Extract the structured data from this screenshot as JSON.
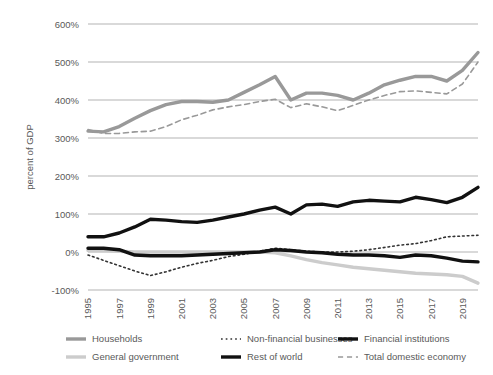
{
  "chart_data": {
    "type": "line",
    "title": "",
    "xlabel": "",
    "ylabel": "percent of GDP",
    "ylim": [
      -100,
      600
    ],
    "yticks": [
      -100,
      0,
      100,
      200,
      300,
      400,
      500,
      600
    ],
    "ytick_labels": [
      "-100%",
      "0%",
      "100%",
      "200%",
      "300%",
      "400%",
      "500%",
      "600%"
    ],
    "grid": true,
    "legend_position": "bottom",
    "x": [
      1995,
      1996,
      1997,
      1998,
      1999,
      2000,
      2001,
      2002,
      2003,
      2004,
      2005,
      2006,
      2007,
      2008,
      2009,
      2010,
      2011,
      2012,
      2013,
      2014,
      2015,
      2016,
      2017,
      2018,
      2019,
      2020
    ],
    "xtick_labels": [
      "1995",
      "1997",
      "1999",
      "2001",
      "2003",
      "2005",
      "2007",
      "2009",
      "2011",
      "2013",
      "2015",
      "2017",
      "2019"
    ],
    "xticks": [
      1995,
      1997,
      1999,
      2001,
      2003,
      2005,
      2007,
      2009,
      2011,
      2013,
      2015,
      2017,
      2019
    ],
    "series": [
      {
        "name": "Households",
        "color": "#999999",
        "style": "solid",
        "width": 3.4,
        "values": [
          318,
          316,
          330,
          352,
          372,
          388,
          396,
          396,
          394,
          400,
          420,
          440,
          462,
          400,
          418,
          418,
          412,
          400,
          418,
          440,
          452,
          462,
          462,
          450,
          478,
          525
        ]
      },
      {
        "name": "General government",
        "color": "#cccccc",
        "style": "solid",
        "width": 3.4,
        "values": [
          4,
          4,
          2,
          0,
          0,
          0,
          0,
          0,
          0,
          0,
          0,
          0,
          -2,
          -10,
          -20,
          -28,
          -34,
          -40,
          -44,
          -48,
          -52,
          -56,
          -58,
          -60,
          -64,
          -82
        ]
      },
      {
        "name": "Non-financial businesses",
        "color": "#333333",
        "style": "dotted",
        "width": 1.6,
        "values": [
          -8,
          -22,
          -36,
          -50,
          -62,
          -52,
          -40,
          -30,
          -22,
          -12,
          -6,
          2,
          10,
          6,
          2,
          0,
          0,
          2,
          6,
          12,
          18,
          22,
          30,
          40,
          42,
          44
        ]
      },
      {
        "name": "Rest of world",
        "color": "#111111",
        "style": "solid",
        "width": 3.4,
        "values": [
          10,
          10,
          6,
          -8,
          -10,
          -10,
          -10,
          -8,
          -6,
          -4,
          -2,
          0,
          6,
          4,
          0,
          -2,
          -6,
          -8,
          -8,
          -10,
          -14,
          -8,
          -10,
          -16,
          -24,
          -26
        ]
      },
      {
        "name": "Financial institutions",
        "color": "#111111",
        "style": "solid",
        "width": 3.4,
        "values": [
          40,
          40,
          50,
          66,
          86,
          84,
          80,
          78,
          84,
          92,
          100,
          110,
          118,
          100,
          124,
          126,
          120,
          132,
          136,
          134,
          132,
          144,
          138,
          130,
          144,
          170
        ]
      },
      {
        "name": "Total domestic economy",
        "color": "#999999",
        "style": "dashed",
        "width": 1.6,
        "values": [
          322,
          312,
          312,
          316,
          318,
          330,
          348,
          360,
          374,
          382,
          388,
          396,
          402,
          380,
          390,
          382,
          372,
          386,
          400,
          412,
          422,
          424,
          420,
          416,
          442,
          500
        ]
      }
    ],
    "legend": [
      {
        "label": "Households",
        "color": "#999999",
        "style": "solid",
        "width": 3.4
      },
      {
        "label": "Non-financial businesses",
        "color": "#333333",
        "style": "dotted",
        "width": 1.6
      },
      {
        "label": "Financial institutions",
        "color": "#111111",
        "style": "solid",
        "width": 3.4
      },
      {
        "label": "General government",
        "color": "#cccccc",
        "style": "solid",
        "width": 3.4
      },
      {
        "label": "Rest of world",
        "color": "#111111",
        "style": "solid",
        "width": 3.4
      },
      {
        "label": "Total domestic economy",
        "color": "#999999",
        "style": "dashed",
        "width": 1.6
      }
    ]
  },
  "layout": {
    "plot_left": 88,
    "plot_right": 478,
    "plot_top": 24,
    "plot_bottom": 290,
    "legend_rows_y": [
      339,
      357
    ],
    "legend_cols_x": [
      66,
      221,
      338
    ]
  }
}
